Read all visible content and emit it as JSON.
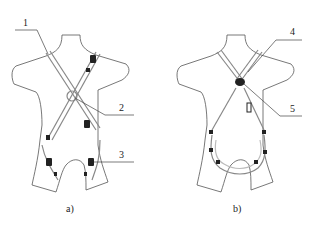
{
  "figure": {
    "panels": [
      {
        "id": "a",
        "caption": "a)",
        "callouts": [
          {
            "num": "1",
            "target": "shoulder strap"
          },
          {
            "num": "2",
            "target": "back D-ring crossover"
          },
          {
            "num": "3",
            "target": "leg strap buckle"
          }
        ]
      },
      {
        "id": "b",
        "caption": "b)",
        "callouts": [
          {
            "num": "4",
            "target": "shoulder strap"
          },
          {
            "num": "5",
            "target": "front D-ring"
          }
        ]
      }
    ],
    "colors": {
      "outline": "#555555",
      "strap": "#888888",
      "hardware": "#222222",
      "background": "#ffffff"
    }
  }
}
